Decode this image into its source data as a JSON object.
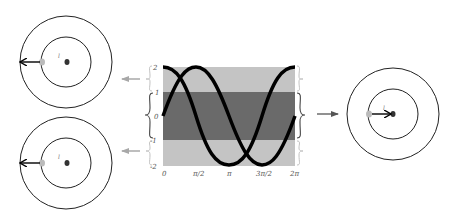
{
  "diagram": {
    "colors": {
      "outer_band": "#c4c4c4",
      "middle_band": "#6a6a6a",
      "curve": "#000000",
      "circle": "#222222",
      "arrow_gray": "#a8a8a8",
      "brace": "#bbbbbb",
      "dark_brace": "#444444"
    },
    "plot": {
      "y_ticks": [
        "2",
        "1",
        "0",
        "-1",
        "-2"
      ],
      "x_ticks": [
        "0",
        "π/2",
        "π",
        "3π/2",
        "2π"
      ],
      "bands": [
        {
          "name": "upper",
          "from": 1,
          "to": 2,
          "shade": "light"
        },
        {
          "name": "middle",
          "from": -1,
          "to": 1,
          "shade": "dark"
        },
        {
          "name": "lower",
          "from": -2,
          "to": -1,
          "shade": "light"
        }
      ],
      "curves": [
        {
          "name": "sine",
          "amplitude": 2
        },
        {
          "name": "cosine",
          "amplitude": 2
        }
      ]
    },
    "panels": [
      {
        "name": "top-left",
        "label": "l",
        "arrow_direction": "left"
      },
      {
        "name": "bottom-left",
        "label": "l",
        "arrow_direction": "left"
      },
      {
        "name": "right",
        "label": "l",
        "arrow_direction": "right"
      }
    ]
  }
}
